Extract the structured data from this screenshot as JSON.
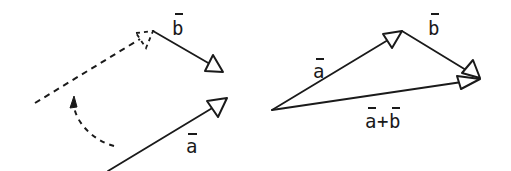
{
  "figure": {
    "colors": {
      "ink": "#1a1a1a",
      "background": "#ffffff"
    }
  },
  "left_panel": {
    "labels": {
      "vector_b": "b",
      "vector_a": "a"
    },
    "vectors": [
      {
        "name": "b",
        "from": [
          153,
          31
        ],
        "to": [
          223,
          72
        ],
        "style": "solid"
      },
      {
        "name": "a",
        "from": [
          108,
          171
        ],
        "to": [
          227,
          98
        ],
        "style": "solid"
      },
      {
        "name": "a-translated",
        "from": [
          35,
          103
        ],
        "to": [
          153,
          31
        ],
        "style": "dashed"
      }
    ],
    "rotation_arrow": {
      "style": "dashed-curve",
      "direction": "up"
    }
  },
  "right_panel": {
    "labels": {
      "vector_a": "a",
      "vector_b": "b",
      "sum_a": "a",
      "sum_plus": "+",
      "sum_b": "b"
    },
    "vectors": [
      {
        "name": "a",
        "from": [
          272,
          110
        ],
        "to": [
          402,
          31
        ]
      },
      {
        "name": "b",
        "from": [
          402,
          31
        ],
        "to": [
          480,
          78
        ]
      },
      {
        "name": "a+b",
        "from": [
          272,
          110
        ],
        "to": [
          480,
          79
        ]
      }
    ]
  }
}
